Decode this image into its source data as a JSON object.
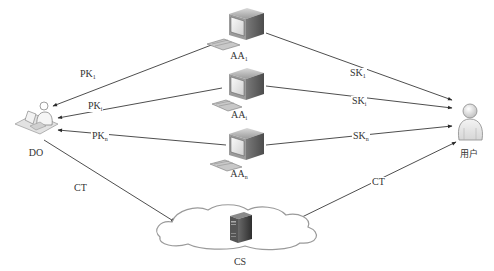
{
  "diagram": {
    "type": "network-architecture",
    "nodes": {
      "aa1": {
        "label": "AA",
        "sub": "1"
      },
      "aai": {
        "label": "AA",
        "sub": "i"
      },
      "aan": {
        "label": "AA",
        "sub": "n"
      },
      "do": {
        "label": "DO"
      },
      "user": {
        "label": "用户"
      },
      "cs": {
        "label": "CS"
      }
    },
    "edges": {
      "pk1": {
        "label": "PK",
        "sub": "1",
        "from": "AA1",
        "to": "DO"
      },
      "pki": {
        "label": "PK",
        "sub": "i",
        "from": "AAi",
        "to": "DO"
      },
      "pkn": {
        "label": "PK",
        "sub": "n",
        "from": "AAn",
        "to": "DO"
      },
      "sk1": {
        "label": "SK",
        "sub": "1",
        "from": "AA1",
        "to": "用户"
      },
      "ski": {
        "label": "SK",
        "sub": "i",
        "from": "AAi",
        "to": "用户"
      },
      "skn": {
        "label": "SK",
        "sub": "n",
        "from": "AAn",
        "to": "用户"
      },
      "ct_do": {
        "label": "CT",
        "from": "DO",
        "to": "CS"
      },
      "ct_user": {
        "label": "CT",
        "from": "CS",
        "to": "用户"
      }
    },
    "colors": {
      "line": "#3a3a3a",
      "cloud_stroke": "#9a9a9a",
      "server": "#4a4a4a",
      "monitor": "#6b6b6b"
    }
  }
}
